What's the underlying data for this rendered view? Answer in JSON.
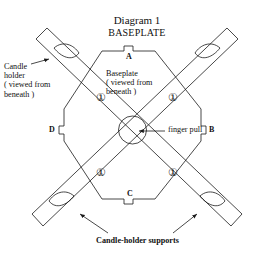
{
  "diagram": {
    "title": "Diagram 1",
    "subtitle": "BASEPLATE",
    "view_note": "viewed from beneath"
  },
  "labels": {
    "candle_holder": "Candle\nholder\n( viewed from\nbeneath )",
    "baseplate": "Baseplate\n( viewed from\nbeneath )",
    "finger_pull": "finger pull",
    "candle_holder_supports": "Candle-holder supports"
  },
  "tabs": [
    {
      "id": "A",
      "label": "A",
      "position": "top"
    },
    {
      "id": "B",
      "label": "B",
      "position": "right"
    },
    {
      "id": "C",
      "label": "C",
      "position": "bottom"
    },
    {
      "id": "D",
      "label": "D",
      "position": "left"
    }
  ],
  "markers": [
    {
      "id": "marker-top-left",
      "symbol": "①"
    },
    {
      "id": "marker-top-right",
      "symbol": "①"
    },
    {
      "id": "marker-bottom-left",
      "symbol": "①"
    },
    {
      "id": "marker-bottom-right",
      "symbol": "①"
    }
  ],
  "colors": {
    "stroke": "#1a1a1a",
    "text": "#111111",
    "background": "#ffffff"
  }
}
